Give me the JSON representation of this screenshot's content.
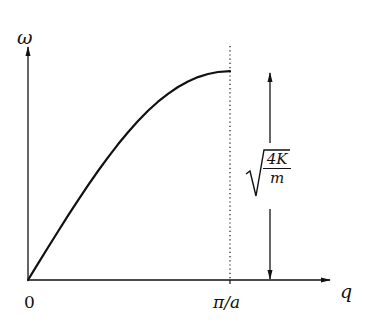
{
  "figure": {
    "type": "dispersion-relation-diagram",
    "axes": {
      "y_label": "ω",
      "x_label": "q",
      "origin_label": "0",
      "x_tick_label": "π/a"
    },
    "annotation": {
      "label_prefix": "√",
      "numerator": "4K",
      "denominator": "m",
      "meaning": "maximum frequency ω_max = √(4K/m), marked with a double-headed arrow"
    },
    "curve": {
      "description": "ω(q) = √(4K/m)·sin(qa/2), rising linearly near 0 and flattening at the zone boundary π/a",
      "color": "#111111"
    },
    "boundary_line": {
      "style": "dotted",
      "at": "π/a"
    }
  },
  "colors": {
    "ink": "#111111",
    "background": "#ffffff"
  }
}
